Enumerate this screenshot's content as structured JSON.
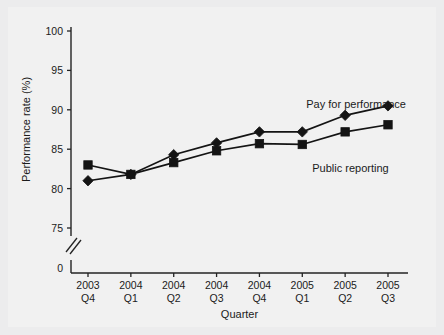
{
  "figure": {
    "background_color": "#ececed",
    "panel_color": "#f1f1f1",
    "ink_color": "#141414"
  },
  "axes": {
    "y_title": "Performance rate (%)",
    "x_title": "Quarter",
    "y_tick_labels": [
      "100",
      "95",
      "90",
      "85",
      "80",
      "75",
      "0"
    ],
    "y_tick_values": [
      100,
      95,
      90,
      85,
      80,
      75,
      0
    ],
    "axis_break": true,
    "x_tick_labels": [
      {
        "year": "2003",
        "quarter": "Q4"
      },
      {
        "year": "2004",
        "quarter": "Q1"
      },
      {
        "year": "2004",
        "quarter": "Q2"
      },
      {
        "year": "2004",
        "quarter": "Q3"
      },
      {
        "year": "2004",
        "quarter": "Q4"
      },
      {
        "year": "2005",
        "quarter": "Q1"
      },
      {
        "year": "2005",
        "quarter": "Q2"
      },
      {
        "year": "2005",
        "quarter": "Q3"
      }
    ]
  },
  "series_labels": {
    "pay_for_performance": "Pay for performance",
    "public_reporting": "Public reporting"
  },
  "chart_data": {
    "type": "line",
    "title": "",
    "xlabel": "Quarter",
    "ylabel": "Performance rate (%)",
    "categories": [
      "2003 Q4",
      "2004 Q1",
      "2004 Q2",
      "2004 Q3",
      "2004 Q4",
      "2005 Q1",
      "2005 Q2",
      "2005 Q3"
    ],
    "ylim": [
      75,
      100
    ],
    "yticks": [
      75,
      80,
      85,
      90,
      95,
      100
    ],
    "axis_break_below": 75,
    "grid": false,
    "legend_position": "inline-annotation",
    "series": [
      {
        "name": "Pay for performance",
        "marker": "diamond",
        "values": [
          81.0,
          81.8,
          84.3,
          85.8,
          87.2,
          87.2,
          89.3,
          90.5
        ]
      },
      {
        "name": "Public reporting",
        "marker": "square",
        "values": [
          83.0,
          81.8,
          83.3,
          84.8,
          85.7,
          85.6,
          87.2,
          88.1
        ]
      }
    ]
  }
}
